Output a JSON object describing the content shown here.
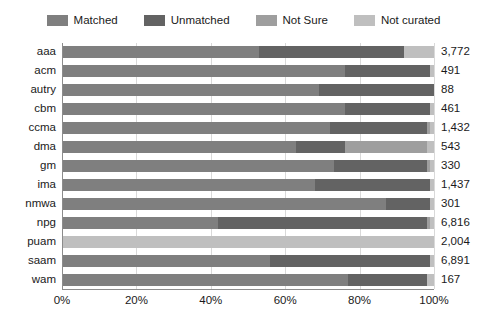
{
  "chart_data": {
    "type": "bar",
    "subtype": "stacked-horizontal-100pct",
    "title": "",
    "subtitle": "",
    "xlabel": "",
    "ylabel": "",
    "categories": [
      "aaa",
      "acm",
      "autry",
      "cbm",
      "ccma",
      "dma",
      "gm",
      "ima",
      "nmwa",
      "npg",
      "puam",
      "saam",
      "wam"
    ],
    "series": [
      {
        "name": "Matched",
        "color": "#7f7f7f",
        "values": [
          53,
          76,
          69,
          76,
          72,
          63,
          73,
          68,
          87,
          42,
          0,
          56,
          77
        ]
      },
      {
        "name": "Unmatched",
        "color": "#636363",
        "values": [
          39,
          23,
          31,
          23,
          26,
          13,
          25,
          31,
          12,
          56,
          0,
          43,
          21
        ]
      },
      {
        "name": "Not Sure",
        "color": "#9e9e9e",
        "values": [
          0,
          0,
          0,
          0,
          1,
          22,
          1,
          0,
          0,
          1,
          0,
          0,
          0
        ]
      },
      {
        "name": "Not curated",
        "color": "#bfbfbf",
        "values": [
          8,
          1,
          0,
          1,
          1,
          2,
          1,
          1,
          1,
          1,
          100,
          1,
          2
        ]
      }
    ],
    "value_labels": [
      "3,772",
      "491",
      "88",
      "461",
      "1,432",
      "543",
      "330",
      "1,437",
      "301",
      "6,816",
      "2,004",
      "6,891",
      "167"
    ],
    "xlim": [
      0,
      100
    ],
    "xticks": [
      0,
      20,
      40,
      60,
      80,
      100
    ],
    "xticklabels": [
      "0%",
      "20%",
      "40%",
      "60%",
      "80%",
      "100%"
    ],
    "grid": true,
    "grid_axis": "x",
    "legend_position": "top"
  },
  "legend": {
    "items": [
      {
        "label": "Matched",
        "color": "#7f7f7f",
        "swatch_name": "legend-swatch-matched"
      },
      {
        "label": "Unmatched",
        "color": "#636363",
        "swatch_name": "legend-swatch-unmatched"
      },
      {
        "label": "Not Sure",
        "color": "#9e9e9e",
        "swatch_name": "legend-swatch-not-sure"
      },
      {
        "label": "Not curated",
        "color": "#bfbfbf",
        "swatch_name": "legend-swatch-not-curated"
      }
    ]
  },
  "colors": {
    "matched": "#7f7f7f",
    "unmatched": "#636363",
    "not_sure": "#9e9e9e",
    "not_curated": "#bfbfbf",
    "gridline": "#d9d9d9",
    "axis": "#8c8c8c",
    "text": "#1a1a1a",
    "background": "#ffffff"
  }
}
